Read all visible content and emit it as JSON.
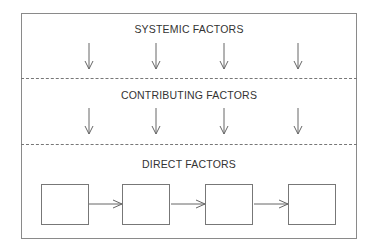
{
  "diagram": {
    "layers": [
      {
        "label": "SYSTEMIC FACTORS",
        "arrows_down": 4
      },
      {
        "label": "CONTRIBUTING FACTORS",
        "arrows_down": 4
      },
      {
        "label": "DIRECT FACTORS",
        "chain_boxes": 4
      }
    ],
    "colors": {
      "line": "#777777",
      "text": "#333333",
      "background": "#ffffff"
    }
  }
}
